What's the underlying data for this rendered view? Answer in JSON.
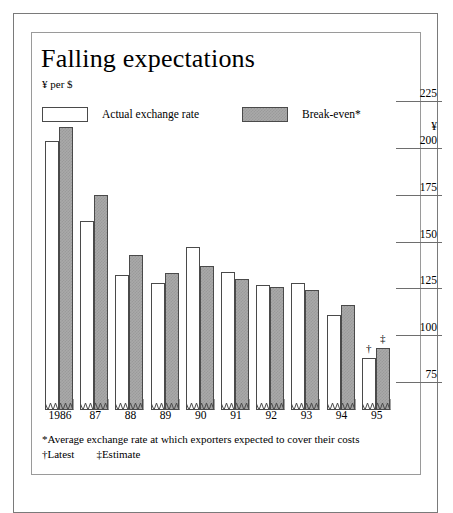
{
  "chart_data": {
    "type": "bar",
    "title": "Falling expectations",
    "subtitle": "¥ per $",
    "ylabel": "¥",
    "xlabel": "",
    "categories": [
      "1986",
      "87",
      "88",
      "89",
      "90",
      "91",
      "92",
      "93",
      "94",
      "95"
    ],
    "series": [
      {
        "name": "Actual exchange rate",
        "values": [
          204,
          161,
          132,
          128,
          147,
          134,
          127,
          128,
          111,
          88
        ]
      },
      {
        "name": "Break-even*",
        "values": [
          211,
          175,
          143,
          133,
          137,
          130,
          126,
          124,
          116,
          93
        ]
      }
    ],
    "ylim": [
      60,
      231
    ],
    "yticks": [
      225,
      200,
      175,
      150,
      125,
      100,
      75
    ],
    "ytick_labels": [
      "225",
      "200",
      "175",
      "150",
      "125",
      "100",
      "75"
    ],
    "grid": false,
    "legend_position": "top",
    "annotations": [
      {
        "text": "†",
        "category": "95",
        "series": "Actual exchange rate"
      },
      {
        "text": "‡",
        "category": "95",
        "series": "Break-even*"
      }
    ],
    "axis_break": "Bars have zigzag broken-axis bases; value axis starts above zero.",
    "footnotes": [
      "*Average exchange rate at which exporters expected to cover their costs",
      "†Latest",
      "‡Estimate"
    ]
  },
  "legend": {
    "actual": {
      "label": "Actual exchange rate",
      "swatch": "white"
    },
    "breakeven": {
      "label": "Break-even*",
      "swatch": "gray"
    }
  },
  "footnotes": {
    "asterisk": "*Average exchange rate at which exporters expected to cover their costs",
    "dagger": "†Latest",
    "doubledagger": "‡Estimate"
  },
  "markers": {
    "latest": "†",
    "estimate": "‡"
  },
  "colors": {
    "background": "#ffffff",
    "ink": "#000000",
    "bar_outline": "#4a4a4a",
    "breakeven_fill": "#a9a9a9",
    "actual_fill": "#ffffff",
    "frame": "#7a7a7a",
    "axis_line": "#6e6e6e"
  }
}
